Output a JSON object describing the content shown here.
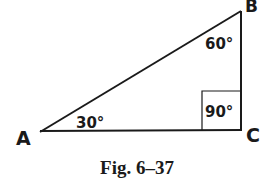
{
  "figure": {
    "caption": "Fig. 6–37",
    "colors": {
      "stroke": "#1a1a1a",
      "background": "#ffffff"
    },
    "vertices": {
      "A": {
        "label": "A",
        "angle": "30°"
      },
      "B": {
        "label": "B",
        "angle": "60°"
      },
      "C": {
        "label": "C",
        "angle": "90°"
      }
    },
    "right_angle_at": "C"
  }
}
